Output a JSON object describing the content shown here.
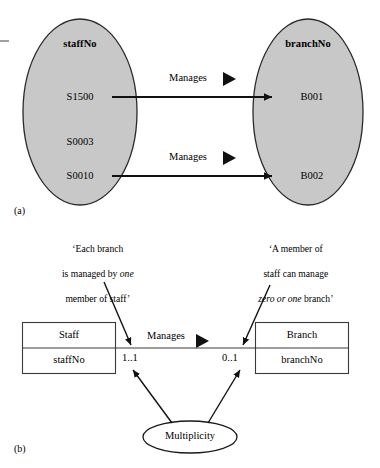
{
  "figure": {
    "panels": [
      {
        "key": "a",
        "label": "(a)",
        "left_set": {
          "header": "staffNo",
          "members": [
            "S1500",
            "S0003",
            "S0010"
          ]
        },
        "right_set": {
          "header": "branchNo",
          "members": [
            "B001",
            "B002"
          ]
        },
        "mappings": [
          {
            "label": "Manages",
            "from": "S1500",
            "to": "B001"
          },
          {
            "label": "Manages",
            "from": "S0010",
            "to": "B002"
          }
        ]
      },
      {
        "key": "b",
        "label": "(b)",
        "left_class": {
          "name": "Staff",
          "attribute": "staffNo"
        },
        "right_class": {
          "name": "Branch",
          "attribute": "branchNo"
        },
        "association": {
          "label": "Manages"
        },
        "multiplicity_left": "1..1",
        "multiplicity_right": "0..1",
        "callout_ellipse": "Multiplicity",
        "note_left": {
          "line1": "‘Each branch",
          "line2_pre": "is managed by ",
          "line2_em": "one",
          "line3": "member of staff’"
        },
        "note_right": {
          "line1": "‘A member of",
          "line2": "staff can manage",
          "line3_em": "zero or one",
          "line3_post": " branch’"
        }
      }
    ]
  },
  "style": {
    "ellipse_fill": "#c8c8c8",
    "stroke": "#1a1a1a",
    "background": "#ffffff"
  }
}
